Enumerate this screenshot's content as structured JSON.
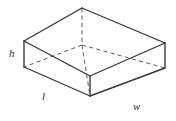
{
  "figure": {
    "name": "rectangular-prism",
    "background_color": "#ffffff",
    "solid_edge_color": "#35353a",
    "hidden_edge_color": "#5d5d63"
  },
  "labels": {
    "height": "h",
    "length": "l",
    "width": "w"
  },
  "geometry": {
    "vertices": {
      "top_back": [
        82,
        8
      ],
      "top_left": [
        24,
        41
      ],
      "top_right": [
        165,
        43
      ],
      "top_front": [
        90,
        76
      ],
      "bottom_left": [
        24,
        67
      ],
      "bottom_right": [
        165,
        68
      ],
      "bottom_front": [
        90,
        96
      ],
      "bottom_back": [
        82,
        45
      ]
    },
    "solid_edges": [
      [
        "top_back",
        "top_left"
      ],
      [
        "top_back",
        "top_right"
      ],
      [
        "top_left",
        "top_front"
      ],
      [
        "top_right",
        "top_front"
      ],
      [
        "top_left",
        "bottom_left"
      ],
      [
        "top_right",
        "bottom_right"
      ],
      [
        "top_front",
        "bottom_front"
      ],
      [
        "bottom_left",
        "bottom_front"
      ],
      [
        "bottom_front",
        "bottom_right"
      ]
    ],
    "hidden_edges": [
      [
        "top_back",
        "bottom_back"
      ],
      [
        "bottom_back",
        "bottom_left"
      ],
      [
        "bottom_back",
        "bottom_right"
      ],
      [
        "bottom_back",
        "bottom_front"
      ]
    ]
  }
}
